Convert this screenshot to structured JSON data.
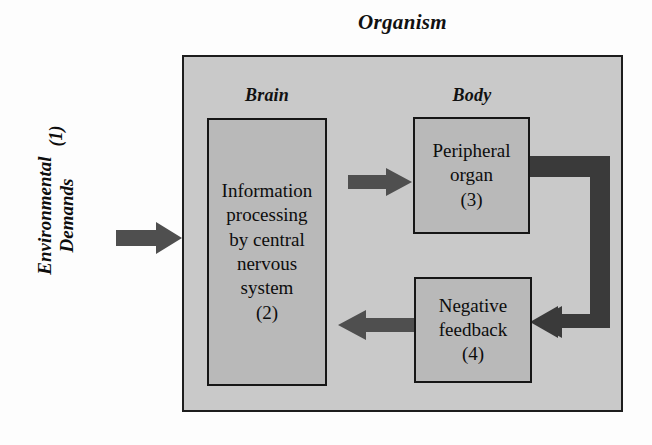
{
  "diagram": {
    "title": "Organism",
    "external_input": {
      "label_line1": "Environmental",
      "label_line2": "Demands",
      "number": "(1)"
    },
    "sections": {
      "brain": "Brain",
      "body": "Body"
    },
    "nodes": {
      "cns": {
        "line1": "Information",
        "line2": "processing",
        "line3": "by central",
        "line4": "nervous",
        "line5": "system",
        "number": "(2)"
      },
      "peripheral_organ": {
        "line1": "Peripheral",
        "line2": "organ",
        "number": "(3)"
      },
      "negative_feedback": {
        "line1": "Negative",
        "line2": "feedback",
        "number": "(4)"
      }
    },
    "arrows": {
      "input_to_cns": "environmental-demands-to-cns",
      "cns_to_organ": "cns-to-peripheral-organ",
      "organ_to_feedback": "peripheral-organ-to-negative-feedback",
      "feedback_to_cns": "negative-feedback-to-cns"
    },
    "colors": {
      "organism_fill": "#c9c9c9",
      "node_fill": "#b9b9b9",
      "arrow": "#4f4f4f",
      "border": "#161616",
      "text": "#0d0d0d",
      "background": "#fdfdfd"
    }
  }
}
